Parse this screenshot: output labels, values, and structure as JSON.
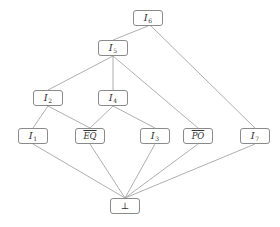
{
  "diagram": {
    "type": "hasse-lattice",
    "colors": {
      "background": "#ffffff",
      "node_border": "#8a8a8a",
      "edge": "#9a9a9a",
      "text": "#333333"
    },
    "nodes": {
      "I6": {
        "base": "I",
        "sub": "6",
        "x": 133,
        "y": 10
      },
      "I5": {
        "base": "I",
        "sub": "5",
        "x": 98,
        "y": 40
      },
      "I2": {
        "base": "I",
        "sub": "2",
        "x": 33,
        "y": 90
      },
      "I4": {
        "base": "I",
        "sub": "4",
        "x": 98,
        "y": 90
      },
      "I1": {
        "base": "I",
        "sub": "1",
        "x": 18,
        "y": 128
      },
      "EQ": {
        "over": "EQ",
        "x": 75,
        "y": 128
      },
      "I3": {
        "base": "I",
        "sub": "3",
        "x": 140,
        "y": 128
      },
      "PO": {
        "over": "PO",
        "x": 183,
        "y": 128
      },
      "I7": {
        "base": "I",
        "sub": "7",
        "x": 240,
        "y": 128
      },
      "bottom": {
        "plain": "⊥",
        "x": 110,
        "y": 198
      }
    },
    "edges": [
      [
        "I6",
        "I5"
      ],
      [
        "I6",
        "I7"
      ],
      [
        "I5",
        "I2"
      ],
      [
        "I5",
        "I4"
      ],
      [
        "I5",
        "PO"
      ],
      [
        "I2",
        "I1"
      ],
      [
        "I2",
        "EQ"
      ],
      [
        "I4",
        "EQ"
      ],
      [
        "I4",
        "I3"
      ],
      [
        "I1",
        "bottom"
      ],
      [
        "EQ",
        "bottom"
      ],
      [
        "I3",
        "bottom"
      ],
      [
        "PO",
        "bottom"
      ],
      [
        "I7",
        "bottom"
      ]
    ]
  }
}
